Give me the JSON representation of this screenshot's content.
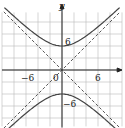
{
  "chart_data": {
    "type": "line",
    "title": "",
    "xlabel": "",
    "ylabel": "y",
    "xlim": [
      -10,
      10
    ],
    "ylim": [
      -10,
      10
    ],
    "grid": true,
    "grid_step": 2,
    "ticks": {
      "x": [
        "-6",
        "0",
        "6"
      ],
      "y": [
        "6",
        "-6"
      ]
    },
    "series": [
      {
        "name": "hyperbola upper branch",
        "style": "solid",
        "equation": "y = sqrt(16 + x^2)",
        "vertex": [
          0,
          4
        ]
      },
      {
        "name": "hyperbola lower branch",
        "style": "solid",
        "equation": "y = -sqrt(16 + x^2)",
        "vertex": [
          0,
          -4
        ]
      },
      {
        "name": "asymptote y = x",
        "style": "dashed",
        "slope": 1
      },
      {
        "name": "asymptote y = -x",
        "style": "dashed",
        "slope": -1
      }
    ]
  },
  "labels": {
    "y_axis": "y",
    "x_neg6": "−6",
    "x_0": "0",
    "x_6": "6",
    "y_6": "6",
    "y_neg6": "−6"
  }
}
